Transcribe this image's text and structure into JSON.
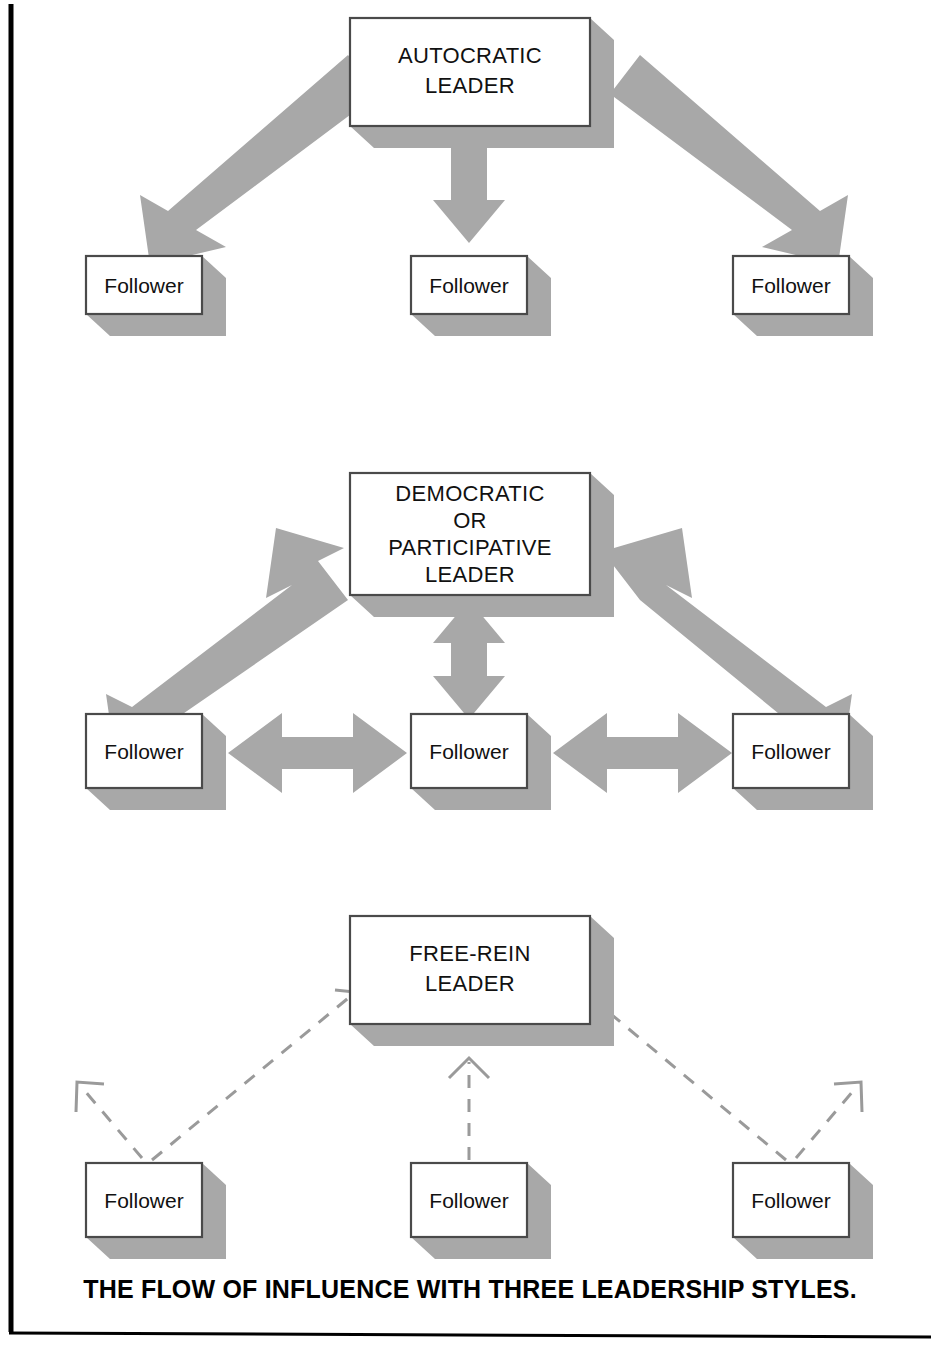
{
  "figure": {
    "caption": "THE FLOW OF INFLUENCE WITH THREE LEADERSHIP STYLES.",
    "colors": {
      "shadow": "#a8a8a8",
      "arrow": "#a8a8a8",
      "box_fill": "#ffffff",
      "box_stroke": "#4a4a4a",
      "dashed_line": "#9a9a9a",
      "text": "#111111",
      "frame": "#000000"
    }
  },
  "sections": [
    {
      "id": "autocratic",
      "leader": {
        "lines": [
          "AUTOCRATIC",
          "LEADER"
        ]
      },
      "followers": [
        {
          "label": "Follower"
        },
        {
          "label": "Follower"
        },
        {
          "label": "Follower"
        }
      ],
      "flow": "one-way from leader to followers",
      "connectors": [
        {
          "kind": "solid-arrow",
          "direction": "down-left",
          "heads": 1
        },
        {
          "kind": "solid-arrow",
          "direction": "down",
          "heads": 1
        },
        {
          "kind": "solid-arrow",
          "direction": "down-right",
          "heads": 1
        }
      ]
    },
    {
      "id": "democratic",
      "leader": {
        "lines": [
          "DEMOCRATIC",
          "OR",
          "PARTICIPATIVE",
          "LEADER"
        ]
      },
      "followers": [
        {
          "label": "Follower"
        },
        {
          "label": "Follower"
        },
        {
          "label": "Follower"
        }
      ],
      "flow": "two-way between leader and followers and among followers",
      "connectors": [
        {
          "kind": "solid-arrow",
          "direction": "diagonal-left",
          "heads": 2
        },
        {
          "kind": "solid-arrow",
          "direction": "vertical",
          "heads": 2
        },
        {
          "kind": "solid-arrow",
          "direction": "diagonal-right",
          "heads": 2
        },
        {
          "kind": "solid-arrow",
          "direction": "horizontal-left-pair",
          "heads": 2
        },
        {
          "kind": "solid-arrow",
          "direction": "horizontal-right-pair",
          "heads": 2
        }
      ]
    },
    {
      "id": "free-rein",
      "leader": {
        "lines": [
          "FREE-REIN",
          "LEADER"
        ]
      },
      "followers": [
        {
          "label": "Follower"
        },
        {
          "label": "Follower"
        },
        {
          "label": "Follower"
        }
      ],
      "flow": "loose dashed influence from followers outward and toward leader",
      "connectors": [
        {
          "kind": "dashed-arrow",
          "direction": "up-left-outward",
          "heads": 1
        },
        {
          "kind": "dashed-arrow",
          "direction": "up-right-to-leader",
          "heads": 1
        },
        {
          "kind": "dashed-arrow",
          "direction": "up-to-leader",
          "heads": 1
        },
        {
          "kind": "dashed-arrow",
          "direction": "up-left-to-leader",
          "heads": 1
        },
        {
          "kind": "dashed-arrow",
          "direction": "up-right-outward",
          "heads": 1
        }
      ]
    }
  ]
}
